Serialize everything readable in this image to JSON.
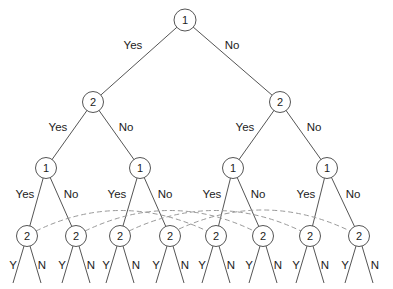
{
  "diagram": {
    "type": "decision-tree",
    "root": {
      "label": "1"
    },
    "level1": [
      {
        "label": "2"
      },
      {
        "label": "2"
      }
    ],
    "level2": [
      {
        "label": "1"
      },
      {
        "label": "1"
      },
      {
        "label": "1"
      },
      {
        "label": "1"
      }
    ],
    "level3": [
      {
        "label": "2"
      },
      {
        "label": "2"
      },
      {
        "label": "2"
      },
      {
        "label": "2"
      },
      {
        "label": "2"
      },
      {
        "label": "2"
      },
      {
        "label": "2"
      },
      {
        "label": "2"
      }
    ],
    "branch_labels": {
      "yes": "Yes",
      "no": "No",
      "y": "Y",
      "n": "N"
    },
    "information_sets": [
      {
        "from_leaf": 1,
        "to_leaf": 5
      },
      {
        "from_leaf": 2,
        "to_leaf": 6
      },
      {
        "from_leaf": 3,
        "to_leaf": 7
      },
      {
        "from_leaf": 4,
        "to_leaf": 8
      }
    ],
    "colors": {
      "line": "#555555",
      "dashed_arc": "#9a9a9a",
      "text": "#222222"
    }
  }
}
